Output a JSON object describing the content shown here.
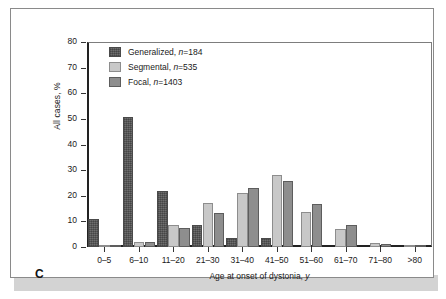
{
  "figure": {
    "panel_label": "C"
  },
  "chart_data": {
    "type": "bar",
    "title": "",
    "subtitle": "",
    "xlabel": "Age at onset of dystonia, y",
    "ylabel": "All cases, %",
    "ylim": [
      0,
      80
    ],
    "yticks": [
      0,
      10,
      20,
      30,
      40,
      50,
      60,
      70,
      80
    ],
    "grid": false,
    "legend_position": "top-left",
    "categories": [
      "0–5",
      "6–10",
      "11–20",
      "21–30",
      "31–40",
      "41–50",
      "51–60",
      "61–70",
      "71–80",
      ">80"
    ],
    "series": [
      {
        "name": "Generalized",
        "n": 184,
        "legend_label": "Generalized, n=184",
        "color": "#6e6e6e",
        "values": [
          11.0,
          50.8,
          21.7,
          8.6,
          3.6,
          3.5,
          0.0,
          0.0,
          0.0,
          0.0
        ]
      },
      {
        "name": "Segmental",
        "n": 535,
        "legend_label": "Segmental, n=535",
        "color": "#c8c8c8",
        "values": [
          0.7,
          2.0,
          8.5,
          17.0,
          20.9,
          28.0,
          13.5,
          7.1,
          1.4,
          0.6
        ]
      },
      {
        "name": "Focal",
        "n": 1403,
        "legend_label": "Focal, n=1403",
        "color": "#8e8e8e",
        "values": [
          0.6,
          1.9,
          7.4,
          13.4,
          23.0,
          25.9,
          16.9,
          8.5,
          1.3,
          0.6
        ]
      }
    ]
  },
  "legend": {
    "items": [
      {
        "label_prefix": "Generalized, ",
        "n_label": "n",
        "n_value": "=184",
        "swatch": "swatch-generalized"
      },
      {
        "label_prefix": "Segmental, ",
        "n_label": "n",
        "n_value": "=535",
        "swatch": "swatch-segmental"
      },
      {
        "label_prefix": "Focal, ",
        "n_label": "n",
        "n_value": "=1403",
        "swatch": "swatch-focal"
      }
    ]
  }
}
